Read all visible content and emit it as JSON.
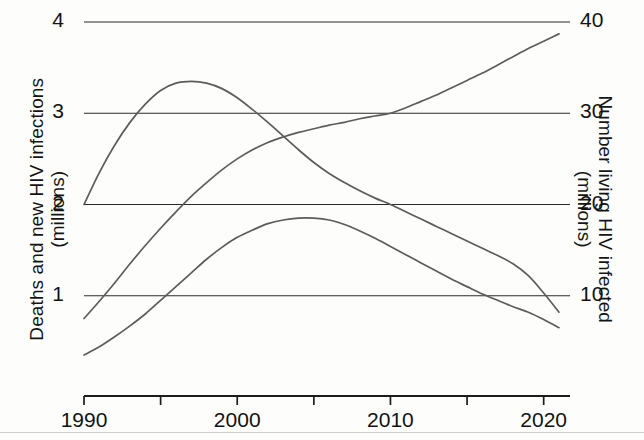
{
  "chart_data": {
    "type": "line",
    "title": "",
    "subtitle": "",
    "xlabel": "",
    "ylabel": "Deaths and new HIV infections (millions)",
    "y2label": "Number living HIV infected (millions)",
    "xlim": [
      1990,
      2021
    ],
    "ylim": [
      0,
      4
    ],
    "y2lim": [
      0,
      40
    ],
    "grid": true,
    "legend": "none",
    "x_ticks": [
      1990,
      1995,
      2000,
      2005,
      2010,
      2015,
      2020
    ],
    "x_tick_labels": [
      "1990",
      "",
      "2000",
      "",
      "2010",
      "",
      "2020"
    ],
    "y_ticks": [
      1,
      2,
      3,
      4
    ],
    "y_tick_labels": [
      "1",
      "2",
      "3",
      "4"
    ],
    "y2_ticks": [
      10,
      20,
      30,
      40
    ],
    "y2_tick_labels": [
      "10",
      "20",
      "30",
      "40"
    ],
    "x": [
      1990,
      1991,
      1992,
      1993,
      1994,
      1995,
      1996,
      1997,
      1998,
      1999,
      2000,
      2001,
      2002,
      2003,
      2004,
      2005,
      2006,
      2007,
      2008,
      2009,
      2010,
      2011,
      2012,
      2013,
      2014,
      2015,
      2016,
      2017,
      2018,
      2019,
      2020,
      2021
    ],
    "series": [
      {
        "name": "New HIV infections",
        "axis": "left",
        "units": "millions",
        "values": [
          2.0,
          2.35,
          2.65,
          2.9,
          3.1,
          3.25,
          3.33,
          3.35,
          3.33,
          3.27,
          3.17,
          3.04,
          2.9,
          2.75,
          2.6,
          2.46,
          2.34,
          2.24,
          2.15,
          2.07,
          2.0,
          1.92,
          1.84,
          1.76,
          1.68,
          1.6,
          1.52,
          1.44,
          1.35,
          1.22,
          1.03,
          0.82
        ]
      },
      {
        "name": "AIDS-related deaths",
        "axis": "left",
        "units": "millions",
        "values": [
          0.35,
          0.44,
          0.55,
          0.67,
          0.8,
          0.95,
          1.1,
          1.25,
          1.4,
          1.53,
          1.64,
          1.72,
          1.79,
          1.83,
          1.85,
          1.85,
          1.83,
          1.78,
          1.71,
          1.63,
          1.54,
          1.45,
          1.36,
          1.27,
          1.18,
          1.1,
          1.02,
          0.95,
          0.88,
          0.82,
          0.74,
          0.65
        ]
      },
      {
        "name": "Number living HIV infected",
        "axis": "right",
        "units": "millions",
        "values": [
          7.5,
          9.4,
          11.4,
          13.5,
          15.5,
          17.4,
          19.2,
          20.9,
          22.4,
          23.8,
          25.0,
          26.0,
          26.8,
          27.4,
          27.9,
          28.3,
          28.7,
          29.0,
          29.4,
          29.7,
          30.0,
          30.6,
          31.3,
          32.0,
          32.8,
          33.6,
          34.4,
          35.3,
          36.2,
          37.1,
          37.9,
          38.7
        ]
      }
    ],
    "annotations": [
      {
        "text": "New HIV infections peak",
        "x": 1997,
        "y": 3.35
      },
      {
        "text": "AIDS-related deaths peak",
        "x": 2005,
        "y": 1.85
      },
      {
        "text": "Number living HIV infected crosses 30 million",
        "x": 2010,
        "y2": 30
      }
    ]
  },
  "axes": {
    "left_title_line1": "Deaths and new HIV infections",
    "left_title_line2": "(millions)",
    "right_title_line1": "Number living HIV infected",
    "right_title_line2": "(millions)"
  }
}
